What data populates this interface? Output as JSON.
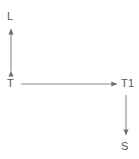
{
  "diagram": {
    "type": "node-arrow-diagram",
    "background_color": "#ffffff",
    "stroke_color": "#7f7f7f",
    "text_color": "#555555",
    "nodes": [
      {
        "id": "L",
        "label": "L",
        "x": 11,
        "y": 17
      },
      {
        "id": "T",
        "label": "T",
        "x": 11,
        "y": 84
      },
      {
        "id": "T1",
        "label": "T1",
        "x": 126,
        "y": 84
      },
      {
        "id": "S",
        "label": "S",
        "x": 126,
        "y": 147
      }
    ],
    "edges": [
      {
        "id": "edge-T-L",
        "from": "T",
        "to": "L",
        "orientation": "vertical",
        "direction": "bidirectional",
        "arrowhead_start": true,
        "arrowhead_end": true,
        "x1": 11,
        "y1": 71,
        "x2": 11,
        "y2": 29
      },
      {
        "id": "edge-T-T1",
        "from": "T",
        "to": "T1",
        "orientation": "horizontal",
        "direction": "forward",
        "arrowhead_start": false,
        "arrowhead_end": true,
        "x1": 21,
        "y1": 84,
        "x2": 117,
        "y2": 84
      },
      {
        "id": "edge-T1-S",
        "from": "T1",
        "to": "S",
        "orientation": "vertical",
        "direction": "forward",
        "arrowhead_start": false,
        "arrowhead_end": true,
        "x1": 126,
        "y1": 95,
        "x2": 126,
        "y2": 135
      }
    ]
  }
}
